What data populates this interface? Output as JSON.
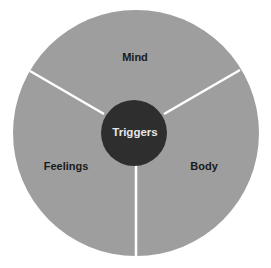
{
  "diagram": {
    "center": {
      "label": "Triggers",
      "color": "#2e2e2e"
    },
    "segments": [
      {
        "label": "Mind",
        "position": "top"
      },
      {
        "label": "Feelings",
        "position": "bottom-left"
      },
      {
        "label": "Body",
        "position": "bottom-right"
      }
    ],
    "segment_color": "#9e9e9e",
    "divider_color": "#ffffff"
  }
}
